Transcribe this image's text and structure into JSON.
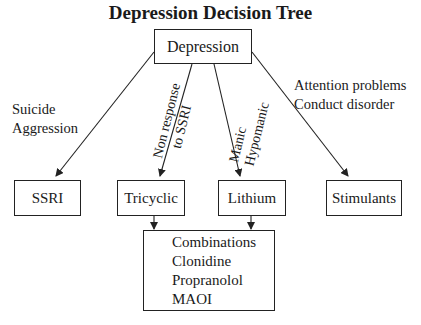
{
  "title": "Depression Decision Tree",
  "nodes": {
    "root": "Depression",
    "ssri": "SSRI",
    "tricyclic": "Tricyclic",
    "lithium": "Lithium",
    "stimulants": "Stimulants",
    "other": [
      "Combinations",
      "Clonidine",
      "Propranolol",
      "MAOI"
    ]
  },
  "edge_labels": {
    "to_ssri": [
      "Suicide",
      "Aggression"
    ],
    "to_tricyclic": [
      "Non response",
      "to SSRI"
    ],
    "to_lithium": [
      "Manic",
      "Hypomanic"
    ],
    "to_stimulants": [
      "Attention problems",
      "Conduct disorder"
    ]
  }
}
